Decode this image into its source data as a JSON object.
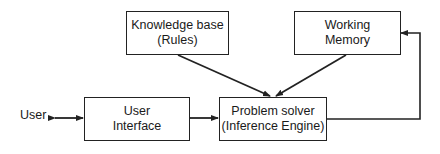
{
  "diagram": {
    "title": "",
    "nodes": {
      "knowledge_base": {
        "line1": "Knowledge base",
        "line2": "(Rules)"
      },
      "working_memory": {
        "line1": "Working",
        "line2": "Memory"
      },
      "user_interface": {
        "line1": "User",
        "line2": "Interface"
      },
      "problem_solver": {
        "line1": "Problem solver",
        "line2": "(Inference Engine)"
      }
    },
    "user_label": "User",
    "edges": [
      {
        "from": "User",
        "to": "User Interface",
        "type": "bidirectional"
      },
      {
        "from": "User Interface",
        "to": "Problem solver",
        "type": "bidirectional"
      },
      {
        "from": "Knowledge base",
        "to": "Problem solver",
        "type": "directed"
      },
      {
        "from": "Working Memory",
        "to": "Problem solver",
        "type": "directed"
      },
      {
        "from": "Problem solver",
        "to": "Working Memory",
        "type": "directed"
      }
    ],
    "colors": {
      "line": "#222222",
      "background": "#ffffff"
    }
  }
}
